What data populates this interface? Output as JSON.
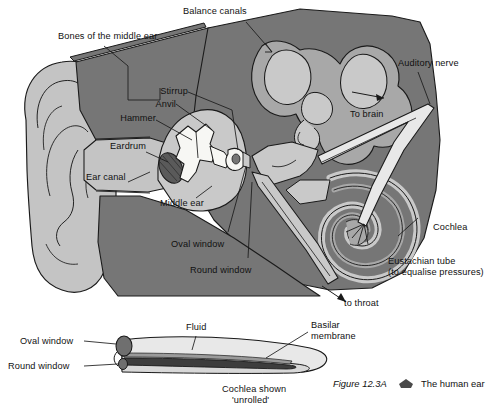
{
  "figure": {
    "number": "Figure 12.3A",
    "marker_icon": "pentagon-marker-icon",
    "title": "The human ear"
  },
  "palette": {
    "head_dark_gray": "#767676",
    "tissue_mid_gray": "#a8a8a8",
    "lumen_light_gray": "#c9c9c9",
    "pinna_gray": "#c4c4c4",
    "bone_white": "#f7f7f4",
    "outline_black": "#1a1a1a",
    "page_white": "#ffffff",
    "window_dark": "#6f6f6f",
    "membrane_dark": "#3d3d3d"
  },
  "main_diagram": {
    "labels": [
      {
        "id": "balance-canals",
        "text": "Balance canals"
      },
      {
        "id": "bones-middle-ear",
        "text": "Bones of the middle ear"
      },
      {
        "id": "stirrup",
        "text": "Stirrup"
      },
      {
        "id": "anvil",
        "text": "Anvil"
      },
      {
        "id": "hammer",
        "text": "Hammer"
      },
      {
        "id": "eardrum",
        "text": "Eardrum"
      },
      {
        "id": "ear-canal",
        "text": "Ear canal"
      },
      {
        "id": "middle-ear",
        "text": "Middle ear"
      },
      {
        "id": "oval-window",
        "text": "Oval window"
      },
      {
        "id": "round-window",
        "text": "Round window"
      },
      {
        "id": "auditory-nerve",
        "text": "Auditory nerve"
      },
      {
        "id": "to-brain",
        "text": "To brain"
      },
      {
        "id": "cochlea",
        "text": "Cochlea"
      },
      {
        "id": "eustachian-tube",
        "text": "Eustachian tube"
      },
      {
        "id": "eustachian-note",
        "text": "(to equalise pressures)"
      },
      {
        "id": "to-throat",
        "text": "to throat"
      }
    ]
  },
  "unrolled_diagram": {
    "labels": [
      {
        "id": "oval-window-unrolled",
        "text": "Oval window"
      },
      {
        "id": "round-window-unrolled",
        "text": "Round window"
      },
      {
        "id": "fluid",
        "text": "Fluid"
      },
      {
        "id": "basilar-membrane-l1",
        "text": "Basilar"
      },
      {
        "id": "basilar-membrane-l2",
        "text": "membrane"
      },
      {
        "id": "cochlea-unrolled-l1",
        "text": "Cochlea shown"
      },
      {
        "id": "cochlea-unrolled-l2",
        "text": "'unrolled'"
      }
    ]
  }
}
